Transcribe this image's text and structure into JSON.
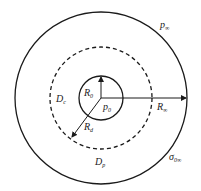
{
  "diagram": {
    "labels": {
      "p_inf": {
        "main": "p",
        "sub": "∞"
      },
      "R0": {
        "main": "R",
        "sub": "0"
      },
      "p0": {
        "main": "p",
        "sub": "0"
      },
      "Dc": {
        "main": "D",
        "sub": "c"
      },
      "Rd": {
        "main": "R",
        "sub": "d"
      },
      "R_inf": {
        "main": "R",
        "sub": "∞"
      },
      "Dp": {
        "main": "D",
        "sub": "p"
      },
      "sigma": {
        "main": "σ",
        "sub": "0∞"
      }
    },
    "colors": {
      "stroke": "#1a1a1a",
      "background": "#ffffff"
    }
  }
}
